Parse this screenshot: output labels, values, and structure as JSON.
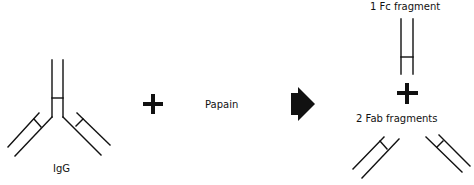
{
  "diagram": {
    "reactant_label": "IgG",
    "enzyme_label": "Papain",
    "products": {
      "fc_label": "1 Fc fragment",
      "fab_label": "2 Fab fragments"
    },
    "symbols": {
      "plus": "plus-sign",
      "arrow": "reaction-arrow"
    },
    "colors": {
      "line": "#111111",
      "background": "#ffffff"
    }
  }
}
